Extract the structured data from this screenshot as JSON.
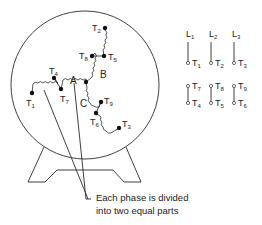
{
  "diagram": {
    "phases": [
      {
        "name": "A",
        "terminals": [
          "T1",
          "T4",
          "T7"
        ]
      },
      {
        "name": "B",
        "terminals": [
          "T2",
          "T5",
          "T8"
        ]
      },
      {
        "name": "C",
        "terminals": [
          "T3",
          "T6",
          "T9"
        ]
      }
    ],
    "phase_labels": {
      "a": "A",
      "b": "B",
      "c": "C"
    },
    "terminal_labels": {
      "t1": {
        "main": "T",
        "sub": "1"
      },
      "t2": {
        "main": "T",
        "sub": "2"
      },
      "t3": {
        "main": "T",
        "sub": "3"
      },
      "t4": {
        "main": "T",
        "sub": "4"
      },
      "t5": {
        "main": "T",
        "sub": "5"
      },
      "t6": {
        "main": "T",
        "sub": "6"
      },
      "t7": {
        "main": "T",
        "sub": "7"
      },
      "t8": {
        "main": "T",
        "sub": "8"
      },
      "t9": {
        "main": "T",
        "sub": "9"
      }
    },
    "caption": {
      "line1": "Each phase is divided",
      "line2": "into two equal parts"
    },
    "connection_chart": {
      "lines": [
        {
          "main": "L",
          "sub": "1"
        },
        {
          "main": "L",
          "sub": "2"
        },
        {
          "main": "L",
          "sub": "3"
        }
      ],
      "row1": [
        {
          "main": "T",
          "sub": "1"
        },
        {
          "main": "T",
          "sub": "2"
        },
        {
          "main": "T",
          "sub": "3"
        }
      ],
      "row2_top": [
        {
          "main": "T",
          "sub": "7"
        },
        {
          "main": "T",
          "sub": "8"
        },
        {
          "main": "T",
          "sub": "9"
        }
      ],
      "row2_bottom": [
        {
          "main": "T",
          "sub": "4"
        },
        {
          "main": "T",
          "sub": "5"
        },
        {
          "main": "T",
          "sub": "6"
        }
      ]
    }
  }
}
